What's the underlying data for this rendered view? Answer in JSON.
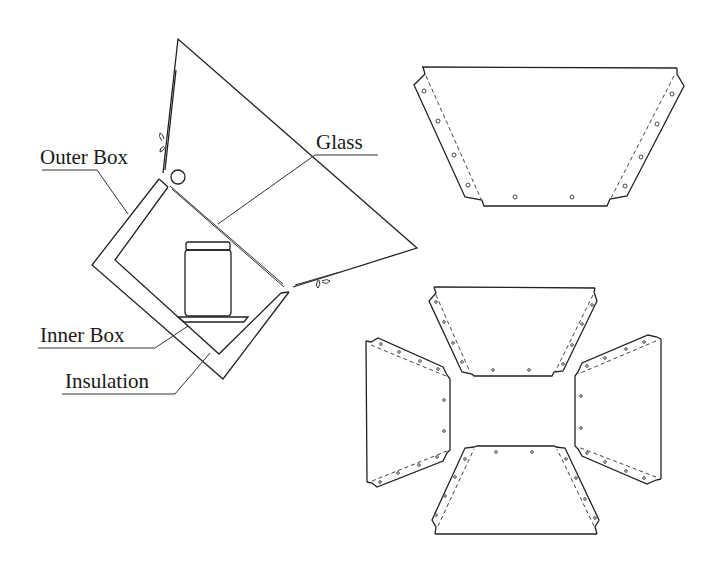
{
  "diagram": {
    "title": "",
    "labels": {
      "outer_box": "Outer Box",
      "glass": "Glass",
      "inner_box": "Inner Box",
      "insulation": "Insulation"
    },
    "components": [
      {
        "id": "reflector",
        "description": "Hinged reflector panel above the oven"
      },
      {
        "id": "outer-box",
        "description": "Outer box (square, tilted)"
      },
      {
        "id": "inner-box",
        "description": "Inner box inside outer box"
      },
      {
        "id": "insulation",
        "description": "Insulation gap between inner and outer box"
      },
      {
        "id": "glass",
        "description": "Glass cover over the opening"
      },
      {
        "id": "jar",
        "description": "Jar on a tray inside inner box"
      },
      {
        "id": "hinges",
        "description": "Two hinges with wing nuts"
      }
    ],
    "panel_templates": {
      "single_panel": {
        "description": "Trapezoid reflector panel template with flaps and screw holes"
      },
      "layout": {
        "description": "Four trapezoid panels arranged in a cross pattern",
        "count": 4
      }
    },
    "colors": {
      "line": "#222222",
      "background": "#ffffff"
    }
  }
}
